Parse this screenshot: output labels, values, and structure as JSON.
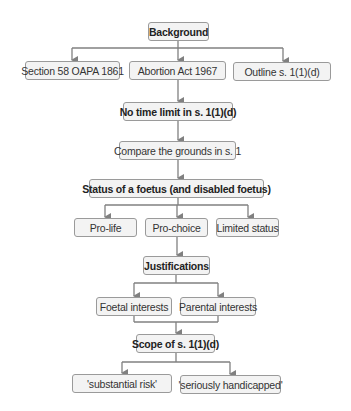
{
  "diagram": {
    "nodes": {
      "background": "Background",
      "section58": "Section 58 OAPA 1861",
      "abortion_act": "Abortion Act 1967",
      "outline": "Outline s. 1(1)(d)",
      "no_time_limit": "No time limit in s. 1(1)(d)",
      "compare": "Compare the grounds in s. 1",
      "status": "Status of a foetus (and disabled foetus)",
      "pro_life": "Pro-life",
      "pro_choice": "Pro-choice",
      "limited_status": "Limited status",
      "justifications": "Justifications",
      "foetal_interests": "Foetal interests",
      "parental_interests": "Parental interests",
      "scope": "Scope of s. 1(1)(d)",
      "substantial_risk": "'substantial risk'",
      "seriously_handicapped": "'seriously handicapped'"
    },
    "edges": [
      [
        "background",
        "section58"
      ],
      [
        "background",
        "abortion_act"
      ],
      [
        "background",
        "outline"
      ],
      [
        "abortion_act",
        "no_time_limit"
      ],
      [
        "no_time_limit",
        "compare"
      ],
      [
        "compare",
        "status"
      ],
      [
        "status",
        "pro_life"
      ],
      [
        "status",
        "pro_choice"
      ],
      [
        "status",
        "limited_status"
      ],
      [
        "pro_choice",
        "justifications"
      ],
      [
        "justifications",
        "foetal_interests"
      ],
      [
        "justifications",
        "parental_interests"
      ],
      [
        "foetal_interests",
        "scope"
      ],
      [
        "parental_interests",
        "scope"
      ],
      [
        "scope",
        "substantial_risk"
      ],
      [
        "scope",
        "seriously_handicapped"
      ]
    ],
    "colors": {
      "box_fill": "#f3f3f3",
      "box_border": "#9a9a9a",
      "connector": "#808080"
    }
  }
}
